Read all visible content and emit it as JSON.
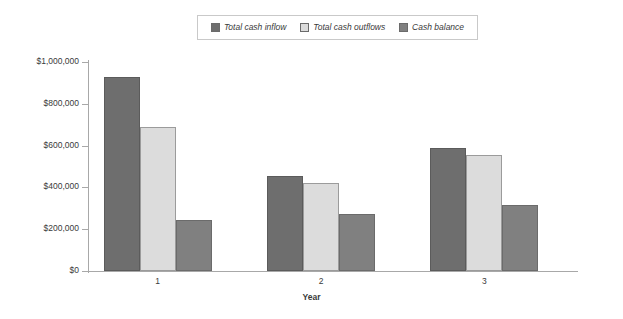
{
  "chart_data": {
    "type": "bar",
    "title": "",
    "xlabel": "Year",
    "ylabel": "",
    "categories": [
      "1",
      "2",
      "3"
    ],
    "series": [
      {
        "name": "Total cash inflow",
        "values": [
          930000,
          455000,
          590000
        ],
        "color": "#6e6e6e"
      },
      {
        "name": "Total cash outflows",
        "values": [
          690000,
          420000,
          555000
        ],
        "color": "#dcdcdc"
      },
      {
        "name": "Cash balance",
        "values": [
          245000,
          273000,
          315000
        ],
        "color": "#808080"
      }
    ],
    "ylim": [
      0,
      1000000
    ],
    "ytick_values": [
      0,
      200000,
      400000,
      600000,
      800000,
      1000000
    ],
    "ytick_labels": [
      "$0",
      "$200,000",
      "$400,000",
      "$600,000",
      "$800,000",
      "$1,000,000"
    ],
    "grid": false,
    "legend_position": "top-center",
    "legend_items": [
      {
        "label": "Total cash inflow",
        "swatch": "#6e6e6e"
      },
      {
        "label": "Total cash outflows",
        "swatch": "#dcdcdc"
      },
      {
        "label": "Cash balance",
        "swatch": "#808080"
      }
    ]
  }
}
